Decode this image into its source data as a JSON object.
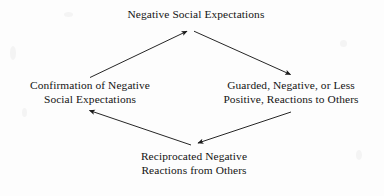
{
  "diagram": {
    "type": "cyclic flow diagram",
    "text_color": "#141414",
    "background_color": "#fdfdfd",
    "line_color": "#1a1a1a",
    "nodes": [
      {
        "id": "top",
        "label": "Negative Social Expectations",
        "lines": [
          "Negative Social Expectations"
        ]
      },
      {
        "id": "left",
        "label": "Confirmation of Negative Social Expectations",
        "lines": [
          "Confirmation of Negative",
          "Social Expectations"
        ]
      },
      {
        "id": "right",
        "label": "Guarded, Negative, or Less Positive, Reactions to Others",
        "lines": [
          "Guarded, Negative, or Less",
          "Positive, Reactions to Others"
        ]
      },
      {
        "id": "bottom",
        "label": "Reciprocated Negative Reactions from Others",
        "lines": [
          "Reciprocated Negative",
          "Reactions from Others"
        ]
      }
    ],
    "arrows": [
      {
        "id": "top-to-right",
        "from": "top",
        "to": "right",
        "direction": "down-right"
      },
      {
        "id": "right-to-bottom",
        "from": "right",
        "to": "bottom",
        "direction": "down-left"
      },
      {
        "id": "bottom-to-left",
        "from": "bottom",
        "to": "left",
        "direction": "up-left"
      },
      {
        "id": "left-to-top",
        "from": "left",
        "to": "top",
        "direction": "up-right"
      }
    ]
  }
}
